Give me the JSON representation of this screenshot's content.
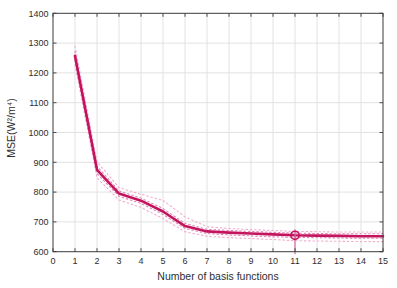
{
  "chart_data": {
    "type": "line",
    "title": "",
    "xlabel": "Number of basis functions",
    "ylabel": "MSE(W²/m⁴)",
    "xlim": [
      0,
      15
    ],
    "ylim": [
      600,
      1400
    ],
    "x_ticks": [
      0,
      1,
      2,
      3,
      4,
      5,
      6,
      7,
      8,
      9,
      10,
      11,
      12,
      13,
      14,
      15
    ],
    "y_ticks": [
      600,
      700,
      800,
      900,
      1000,
      1100,
      1200,
      1300,
      1400
    ],
    "grid": true,
    "legend": "none",
    "x": [
      1,
      2,
      3,
      4,
      5,
      6,
      7,
      8,
      9,
      10,
      11,
      12,
      13,
      14,
      15
    ],
    "series": [
      {
        "name": "upper-band-outer",
        "style": "dotted",
        "color": "#f0aecf",
        "width": 1.1,
        "values": [
          1290,
          902,
          815,
          793,
          772,
          717,
          684,
          678,
          674,
          671,
          668,
          667,
          666,
          666,
          666
        ]
      },
      {
        "name": "lower-band-outer",
        "style": "dotted",
        "color": "#f0aecf",
        "width": 1.1,
        "values": [
          1227,
          848,
          773,
          749,
          711,
          667,
          652,
          647,
          644,
          641,
          637,
          636,
          635,
          634,
          634
        ]
      },
      {
        "name": "upper-band-inner",
        "style": "dotted",
        "color": "#e285b4",
        "width": 1.1,
        "values": [
          1272,
          887,
          804,
          780,
          745,
          695,
          675,
          671,
          668,
          665,
          662,
          661,
          660,
          660,
          660
        ]
      },
      {
        "name": "lower-band-inner",
        "style": "dotted",
        "color": "#e285b4",
        "width": 1.1,
        "values": [
          1243,
          862,
          786,
          762,
          725,
          678,
          661,
          656,
          653,
          650,
          648,
          647,
          646,
          645,
          645
        ]
      },
      {
        "name": "mean-mse",
        "style": "solid",
        "color": "#c2155e",
        "width": 2.6,
        "values": [
          1257,
          875,
          795,
          771,
          735,
          686,
          668,
          664,
          661,
          658,
          655,
          654,
          653,
          652,
          652
        ]
      }
    ],
    "selected_point": {
      "x": 11,
      "y": 655,
      "marker": "open-circle",
      "color": "#c2155e"
    },
    "selected_vline": {
      "x": 11,
      "color": "#d86a9f"
    },
    "colors": {
      "main_line": "#c2155e",
      "band_inner": "#e285b4",
      "band_outer": "#f0aecf",
      "grid": "#e2e2e2",
      "axis": "#3b3b3b",
      "tick_text": "#2e2e2e",
      "background": "#ffffff"
    }
  }
}
